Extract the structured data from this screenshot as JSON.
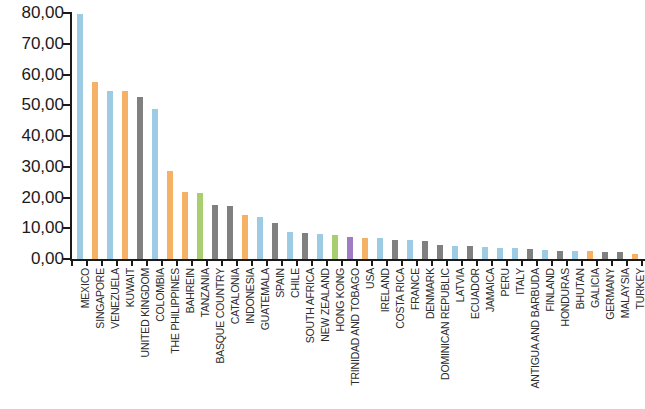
{
  "chart_data": {
    "type": "bar",
    "title": "",
    "subtitle": "",
    "xlabel": "",
    "ylabel": "",
    "ylim": [
      0,
      80
    ],
    "grid": false,
    "legend": "none",
    "y_tick_labels": [
      "80,00",
      "70,00",
      "60,00",
      "50,00",
      "40,00",
      "30,00",
      "20,00",
      "10,00",
      "0,00"
    ],
    "y_tick_values": [
      80,
      70,
      60,
      50,
      40,
      30,
      20,
      10,
      0
    ],
    "decimal_separator": ",",
    "categories": [
      "MEXICO",
      "SINGAPORE",
      "VENEZUELA",
      "KUWAIT",
      "UNITED KINGDOM",
      "COLOMBIA",
      "THE PHILIPPINES",
      "BAHREIN",
      "TANZANIA",
      "BASQUE COUNTRY",
      "CATALONIA",
      "INDONESIA",
      "GUATEMALA",
      "SPAIN",
      "CHILE",
      "SOUTH AFRICA",
      "NEW ZEALAND",
      "HONG KONG",
      "TRINIDAD AND TOBAGO",
      "USA",
      "IRELAND",
      "COSTA RICA",
      "FRANCE",
      "DENMARK",
      "DOMINICAN REPUBLIC",
      "LATVIA",
      "ECUADOR",
      "JAMAICA",
      "PERU",
      "ITALY",
      "ANTIGUA AND BARBUDA",
      "FINLAND",
      "HONDURAS",
      "BHUTAN",
      "GALICIA",
      "GERMANY",
      "MALAYSIA",
      "TURKEY"
    ],
    "values": [
      80.0,
      58.0,
      55.0,
      55.0,
      53.0,
      49.0,
      29.0,
      22.0,
      21.8,
      18.0,
      17.5,
      14.5,
      14.0,
      12.0,
      9.0,
      8.8,
      8.5,
      8.2,
      7.5,
      7.0,
      7.0,
      6.5,
      6.5,
      6.2,
      5.0,
      4.5,
      4.5,
      4.2,
      4.0,
      3.8,
      3.5,
      3.2,
      3.0,
      3.0,
      2.8,
      2.5,
      2.5,
      2.0
    ],
    "bar_colors": [
      "#9dcbe4",
      "#f5b266",
      "#9dcbe4",
      "#f5b266",
      "#808080",
      "#9dcbe4",
      "#f5b266",
      "#f5b266",
      "#a8ce70",
      "#808080",
      "#808080",
      "#f5b266",
      "#9dcbe4",
      "#808080",
      "#9dcbe4",
      "#808080",
      "#9dcbe4",
      "#a8ce70",
      "#a07cc5",
      "#f5b266",
      "#9dcbe4",
      "#808080",
      "#9dcbe4",
      "#808080",
      "#808080",
      "#9dcbe4",
      "#808080",
      "#9dcbe4",
      "#9dcbe4",
      "#9dcbe4",
      "#808080",
      "#9dcbe4",
      "#808080",
      "#9dcbe4",
      "#f5b266",
      "#808080",
      "#808080",
      "#f5b266"
    ],
    "palette": {
      "blue": "#9dcbe4",
      "orange": "#f5b266",
      "gray": "#808080",
      "green": "#a8ce70",
      "purple": "#a07cc5",
      "axis": "#1a1a1a"
    }
  }
}
